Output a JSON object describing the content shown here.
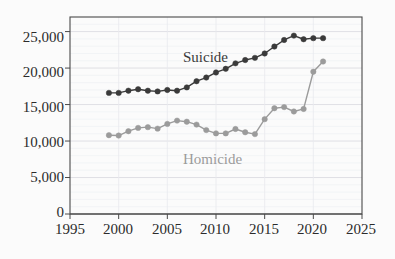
{
  "chart_data": {
    "type": "line",
    "title": "",
    "subtitle": "",
    "xlabel": "",
    "ylabel": "",
    "xlim": [
      1995,
      2025
    ],
    "ylim": [
      0,
      27000
    ],
    "grid": true,
    "grid_axis": "y",
    "legend_position": "inline-annotation",
    "x_ticks": [
      1995,
      2000,
      2005,
      2010,
      2015,
      2020,
      2025
    ],
    "x_tick_labels": [
      "1995",
      "2000",
      "2005",
      "2010",
      "2015",
      "2020",
      "2025"
    ],
    "y_ticks": [
      0,
      5000,
      10000,
      15000,
      20000,
      25000
    ],
    "y_tick_labels": [
      "0",
      "5,000",
      "10,000",
      "15,000",
      "20,000",
      "25,000"
    ],
    "x": [
      1999,
      2000,
      2001,
      2002,
      2003,
      2004,
      2005,
      2006,
      2007,
      2008,
      2009,
      2010,
      2011,
      2012,
      2013,
      2014,
      2015,
      2016,
      2017,
      2018,
      2019,
      2020,
      2021
    ],
    "series": [
      {
        "name": "Suicide",
        "color": "#3a3a3a",
        "marker": "circle",
        "label_position": {
          "x": 183,
          "y": 50
        },
        "values": [
          16600,
          16600,
          16900,
          17100,
          16900,
          16800,
          17000,
          16900,
          17350,
          18200,
          18700,
          19400,
          19900,
          20650,
          21100,
          21400,
          22000,
          22950,
          23850,
          24450,
          23950,
          24100,
          24100
        ]
      },
      {
        "name": "Homicide",
        "color": "#9b9b9b",
        "marker": "circle",
        "label_position": {
          "x": 183,
          "y": 152
        },
        "values": [
          10800,
          10750,
          11350,
          11800,
          11900,
          11700,
          12350,
          12800,
          12650,
          12250,
          11500,
          11050,
          11050,
          11650,
          11200,
          10950,
          13000,
          14500,
          14650,
          14050,
          14400,
          19500,
          20900
        ]
      }
    ]
  },
  "axis": {
    "y_labels": [
      "25,000",
      "20,000",
      "15,000",
      "10,000",
      "5,000",
      "0"
    ],
    "x_labels": [
      "1995",
      "2000",
      "2005",
      "2010",
      "2015",
      "2020",
      "2025"
    ]
  },
  "annotations": {
    "suicide_label": "Suicide",
    "homicide_label": "Homicide"
  },
  "colors": {
    "suicide": "#3a3a3a",
    "homicide": "#9b9b9b",
    "axis": "#4a4a4a",
    "grid": "#e4e4e8",
    "background": "#fbfbfb",
    "tick_text": "#2b2b2b"
  }
}
